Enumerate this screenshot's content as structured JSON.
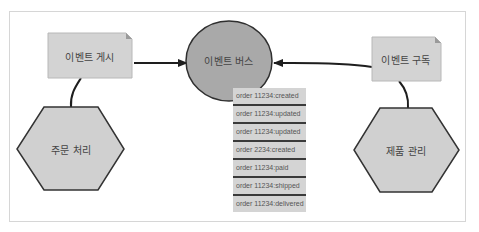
{
  "diagram": {
    "title": "",
    "colors": {
      "box_fill": "#d3d3d3",
      "box_stroke": "#b8b8b8",
      "circle_fill": "#a9a9a9",
      "circle_stroke": "#2f2f2f",
      "hex_fill": "#d0d0d0",
      "hex_stroke": "#333333",
      "list_fill": "#d4d4d4",
      "list_separator": "#3a3a3a",
      "arrow": "#1e1e1e"
    },
    "nodes": {
      "publish": {
        "label": "이벤트 게시",
        "shape": "note"
      },
      "bus": {
        "label": "이벤트 버스",
        "shape": "circle"
      },
      "subscribe": {
        "label": "이벤트 구독",
        "shape": "note"
      },
      "order_service": {
        "label": "주문 처리",
        "shape": "hexagon"
      },
      "product_service": {
        "label": "제품 관리",
        "shape": "hexagon"
      }
    },
    "event_log": [
      "order 11234:created",
      "order 11234:updated",
      "order 11234:updated",
      "order 2234:created",
      "order 11234:paid",
      "order 11234:shipped",
      "order 11234:delivered"
    ],
    "edges": [
      {
        "from": "publish",
        "to": "bus",
        "type": "arrow"
      },
      {
        "from": "subscribe",
        "to": "bus",
        "type": "arrow"
      },
      {
        "from": "order_service",
        "to": "publish",
        "type": "line"
      },
      {
        "from": "product_service",
        "to": "subscribe",
        "type": "line"
      }
    ]
  }
}
